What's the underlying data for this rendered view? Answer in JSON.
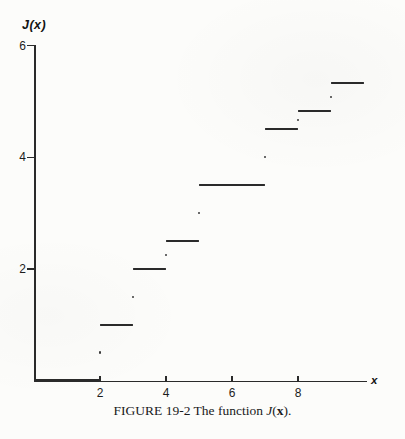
{
  "figure": {
    "y_axis_title": "J(x)",
    "x_axis_title": "x",
    "caption": {
      "prefix": "FIGURE 19-2 The function ",
      "func": "J",
      "open": "(",
      "arg": "x",
      "close": ")."
    }
  },
  "chart_data": {
    "type": "line",
    "subtype": "step-function",
    "title": "FIGURE 19-2 The function J(x).",
    "xlabel": "x",
    "ylabel": "J(x)",
    "xlim": [
      0,
      10.1
    ],
    "ylim": [
      0,
      6
    ],
    "grid": false,
    "legend": "none",
    "x_ticks": [
      2,
      4,
      6,
      8
    ],
    "y_ticks": [
      2,
      4,
      6
    ],
    "line_color": "#2a2a2a",
    "steps": [
      {
        "x_start": 0,
        "x_end": 2,
        "value": 0
      },
      {
        "x_start": 2,
        "x_end": 3,
        "value": 1
      },
      {
        "x_start": 3,
        "x_end": 4,
        "value": 2
      },
      {
        "x_start": 4,
        "x_end": 5,
        "value": 2.5
      },
      {
        "x_start": 5,
        "x_end": 7,
        "value": 3.5
      },
      {
        "x_start": 7,
        "x_end": 8,
        "value": 4.5
      },
      {
        "x_start": 8,
        "x_end": 9,
        "value": 4.8333
      },
      {
        "x_start": 9,
        "x_end": 10,
        "value": 5.3333
      }
    ],
    "jump_points": [
      {
        "x": 2,
        "value": 0.5
      },
      {
        "x": 3,
        "value": 1.5
      },
      {
        "x": 4,
        "value": 2.25
      },
      {
        "x": 5,
        "value": 3.0
      },
      {
        "x": 7,
        "value": 4.0
      },
      {
        "x": 8,
        "value": 4.6667
      },
      {
        "x": 9,
        "value": 5.0833
      }
    ]
  }
}
